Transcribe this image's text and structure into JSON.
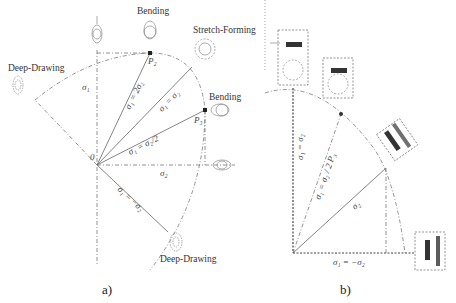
{
  "figure": {
    "panel_a": {
      "caption": "a)",
      "labels": {
        "bending_top": "Bending",
        "stretch_forming": "Stretch-Forming",
        "deep_drawing_left": "Deep-Drawing",
        "bending_right": "Bending",
        "deep_drawing_bottom": "Deep-Drawing"
      },
      "points": {
        "p2": "P₂",
        "p3": "P₃",
        "origin": "0"
      },
      "axes": {
        "sigma1": "σ₁",
        "sigma2": "σ₂"
      },
      "lines": {
        "l1": "σ₁ = 2σ₂",
        "l2": "σ₁ = σ₂",
        "l3": "σ₁ = σ₂/2",
        "l4": "σ₁ = −σ₂"
      }
    },
    "panel_b": {
      "caption": "b)",
      "lines": {
        "vertical": "σ₁ = σ₂",
        "diag": "σ₁ = σ₂ / 2 P₃",
        "mid": "σ₂",
        "bottom": "σ₁ = −σ₂"
      }
    }
  }
}
